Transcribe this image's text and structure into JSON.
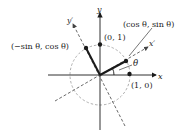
{
  "diagram": {
    "colors": {
      "ink": "#1a1a1a",
      "dashed": "#444444",
      "circle": "#999999"
    },
    "axes": {
      "x_label": "x",
      "y_label": "y",
      "x_prime_label": "x′",
      "y_prime_label": "y′"
    },
    "angle_label": "θ",
    "points": [
      {
        "id": "p10",
        "label": "(1, 0)"
      },
      {
        "id": "p01",
        "label": "(0, 1)"
      },
      {
        "id": "rot_x",
        "label": "(cos θ, sin θ)"
      },
      {
        "id": "rot_y",
        "label": "(−sin θ, cos θ)"
      }
    ]
  }
}
